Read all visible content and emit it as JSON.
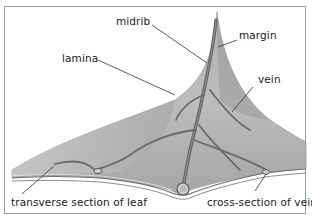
{
  "diagram": {
    "labels": {
      "midrib": "midrib",
      "margin": "margin",
      "lamina": "lamina",
      "vein": "vein",
      "transverse_section": "transverse section of leaf",
      "cross_section_vein": "cross-section of vein"
    },
    "colors": {
      "leaf_light": "#c8c8c8",
      "leaf_mid": "#a8a8a8",
      "leaf_dark": "#7e7e7e",
      "vein": "#6a6a6a",
      "frame_border": "#9a9a9a",
      "leader_line": "#333333",
      "text": "#222222"
    }
  }
}
